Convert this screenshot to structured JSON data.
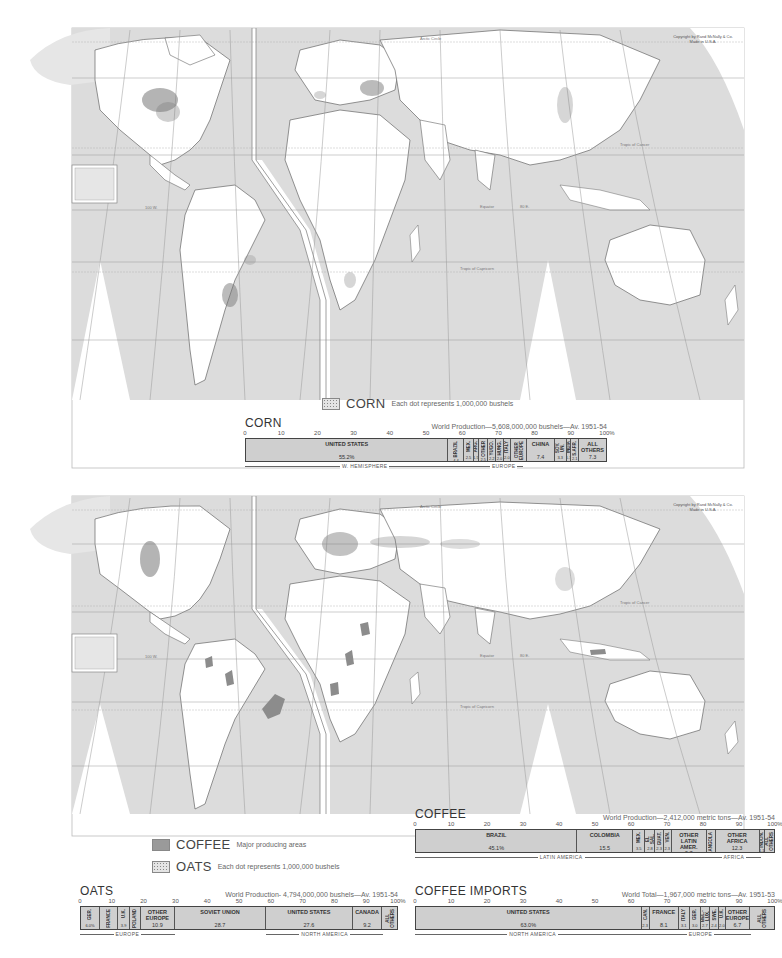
{
  "page": {
    "header_partial": "WORLD — CORN, OATS, COFFEE",
    "copyright": "Copyright by Rand McNally & Co.\nMade in U.S.A."
  },
  "maps": [
    {
      "id": "corn-map",
      "labels": {
        "arctic_circle": "Arctic Circle",
        "tropic_cancer": "Tropic of Cancer",
        "equator": "Equator",
        "tropic_capricorn": "Tropic of Capricorn",
        "meridian_w": "100 W.",
        "meridian_e": "80 E.",
        "lat_40": "40",
        "lat_20": "20",
        "lat_0": "0",
        "inset_lat": "140",
        "inset_lat2": "20"
      },
      "legend": [
        {
          "title": "CORN",
          "desc": "Each dot represents 1,000,000 bushels",
          "swatch": "dots"
        }
      ]
    },
    {
      "id": "oats-coffee-map",
      "labels": {
        "arctic_circle": "Arctic Circle",
        "tropic_cancer": "Tropic of Cancer",
        "equator": "Equator",
        "tropic_capricorn": "Tropic of Capricorn",
        "meridian_w": "100 W.",
        "meridian_e": "80 E.",
        "inset_lat": "140",
        "inset_lat2": "20"
      },
      "legend": [
        {
          "title": "COFFEE",
          "desc": "Major producing areas",
          "swatch": "solid"
        },
        {
          "title": "OATS",
          "desc": "Each dot represents 1,000,000 bushels",
          "swatch": "dots"
        }
      ]
    }
  ],
  "colors": {
    "ocean": "#dcdcdc",
    "land": "#ffffff",
    "coastline": "#666666",
    "grid": "#999999",
    "bar_fill": "#cfcfcf",
    "coffee_area": "#9a9a9a"
  },
  "chart_data": [
    {
      "type": "bar",
      "stacked": true,
      "orientation": "horizontal",
      "title": "CORN",
      "subtitle": "World Production—5,608,000,000 bushels—Av. 1951-54",
      "axis_ticks": [
        "0",
        "10",
        "20",
        "30",
        "40",
        "50",
        "60",
        "70",
        "80",
        "90",
        "100%"
      ],
      "xlim": [
        0,
        100
      ],
      "categories": [
        "UNITED STATES",
        "BRAZIL",
        "MEX.",
        "ARG.",
        "OTHER",
        "YUGO.",
        "HUNG.",
        "ITALY",
        "OTHER EUROPE",
        "CHINA",
        "SOV. UN.",
        "INDIA",
        "S.AFR.",
        "ALL OTHERS"
      ],
      "values": [
        55.2,
        4.4,
        2.5,
        1.5,
        2.5,
        2.2,
        2.0,
        2.0,
        4.5,
        7.4,
        3.3,
        1.3,
        2.1,
        7.3
      ],
      "unit": "%",
      "groups": [
        {
          "label": "W. HEMISPHERE",
          "from": 0,
          "to": 66.1
        },
        {
          "label": "EUROPE",
          "from": 66.1,
          "to": 76.8
        }
      ]
    },
    {
      "type": "bar",
      "stacked": true,
      "orientation": "horizontal",
      "title": "OATS",
      "subtitle": "World Production- 4,794,000,000 bushels—Av. 1951-54",
      "axis_ticks": [
        "0",
        "10",
        "20",
        "30",
        "40",
        "50",
        "60",
        "70",
        "80",
        "90",
        "100%"
      ],
      "xlim": [
        0,
        100
      ],
      "categories": [
        "GER.",
        "FRANCE",
        "U.K.",
        "POLAND",
        "OTHER EUROPE",
        "SOVIET UNION",
        "UNITED STATES",
        "CANADA",
        "ALL OTHERS"
      ],
      "values": [
        6.0,
        5.7,
        3.9,
        3.3,
        10.9,
        28.7,
        27.6,
        9.2,
        5.0
      ],
      "unit": "%",
      "groups": [
        {
          "label": "EUROPE",
          "from": 0,
          "to": 29.8
        },
        {
          "label": "NORTH AMERICA",
          "from": 58.5,
          "to": 95.3
        }
      ]
    },
    {
      "type": "bar",
      "stacked": true,
      "orientation": "horizontal",
      "title": "COFFEE",
      "subtitle": "World Production—2,412,000 metric tons—Av. 1951-54",
      "axis_ticks": [
        "0",
        "10",
        "20",
        "30",
        "40",
        "50",
        "60",
        "70",
        "80",
        "90",
        "100%"
      ],
      "xlim": [
        0,
        100
      ],
      "categories": [
        "BRAZIL",
        "COLOMBIA",
        "MEX.",
        "EL SAL.",
        "GUAT.",
        "VEN.",
        "OTHER LATIN AMER.",
        "ANGOLA",
        "OTHER AFRICA",
        "INDON.",
        "ALL OTHERS"
      ],
      "values": [
        45.1,
        15.5,
        3.5,
        2.8,
        2.3,
        2.3,
        9.7,
        2.5,
        12.3,
        1.1,
        2.9
      ],
      "unit": "%",
      "groups": [
        {
          "label": "LATIN AMERICA",
          "from": 0,
          "to": 81.2
        },
        {
          "label": "AFRICA",
          "from": 81.2,
          "to": 96.0
        }
      ]
    },
    {
      "type": "bar",
      "stacked": true,
      "orientation": "horizontal",
      "title": "COFFEE IMPORTS",
      "subtitle": "World Total—1,967,000 metric tons—Av. 1951-53",
      "axis_ticks": [
        "0",
        "10",
        "20",
        "30",
        "40",
        "50",
        "60",
        "70",
        "80",
        "90",
        "100%"
      ],
      "xlim": [
        0,
        100
      ],
      "categories": [
        "UNITED STATES",
        "CAN.",
        "FRANCE",
        "ITALY",
        "GER.",
        "BEL.-LUX.",
        "SWE.",
        "U.K.",
        "OTHER EUROPE",
        "ALL OTHERS"
      ],
      "values": [
        63.0,
        2.3,
        8.1,
        3.1,
        3.0,
        2.7,
        2.4,
        2.0,
        6.7,
        6.7
      ],
      "unit": "%",
      "groups": [
        {
          "label": "NORTH AMERICA",
          "from": 0,
          "to": 65.3
        },
        {
          "label": "EUROPE",
          "from": 65.3,
          "to": 93.3
        }
      ]
    }
  ],
  "charts_display": {
    "corn": {
      "title": "CORN",
      "subtitle": "World Production—5,608,000,000 bushels—Av. 1951-54",
      "segments": [
        {
          "label": "UNITED STATES",
          "value": "55.2%",
          "w": 55.2
        },
        {
          "label": "BRAZIL",
          "value": "4.4",
          "w": 4.4,
          "narrow": true
        },
        {
          "label": "MEX.",
          "value": "2.5",
          "w": 2.5,
          "narrow": true
        },
        {
          "label": "ARG.",
          "value": "1.5",
          "w": 1.5,
          "narrow": true
        },
        {
          "label": "OTHER",
          "value": "2.5",
          "w": 2.5,
          "narrow": true
        },
        {
          "label": "YUGO.",
          "value": "2.2",
          "w": 2.2,
          "narrow": true
        },
        {
          "label": "HUNG.",
          "value": "2.0",
          "w": 2.0,
          "narrow": true
        },
        {
          "label": "ITALY",
          "value": "2.0",
          "w": 2.0,
          "narrow": true
        },
        {
          "label": "OTHER EUROPE",
          "value": "4.5",
          "w": 4.5,
          "narrow": true
        },
        {
          "label": "CHINA",
          "value": "7.4",
          "w": 7.4
        },
        {
          "label": "SOV. UN.",
          "value": "3.3",
          "w": 3.3,
          "narrow": true
        },
        {
          "label": "INDIA",
          "value": "1.3",
          "w": 1.3,
          "narrow": true
        },
        {
          "label": "S.AFR.",
          "value": "2.1",
          "w": 2.1,
          "narrow": true
        },
        {
          "label": "ALL\nOTHERS",
          "value": "7.3",
          "w": 7.3
        }
      ],
      "regions": [
        {
          "label": "W. HEMISPHERE",
          "from": 0,
          "to": 66.1
        },
        {
          "label": "EUROPE",
          "from": 66.1,
          "to": 76.8
        }
      ]
    },
    "oats": {
      "title": "OATS",
      "subtitle": "World Production- 4,794,000,000 bushels—Av. 1951-54",
      "segments": [
        {
          "label": "GER.",
          "value": "6.0%",
          "w": 6.0,
          "narrow": true
        },
        {
          "label": "FRANCE",
          "value": "5.7",
          "w": 5.7,
          "narrow": true
        },
        {
          "label": "U.K.",
          "value": "3.9",
          "w": 3.9,
          "narrow": true
        },
        {
          "label": "POLAND",
          "value": "3.3",
          "w": 3.3,
          "narrow": true
        },
        {
          "label": "OTHER\nEUROPE",
          "value": "10.9",
          "w": 10.9
        },
        {
          "label": "SOVIET  UNION",
          "value": "28.7",
          "w": 28.7
        },
        {
          "label": "UNITED STATES",
          "value": "27.6",
          "w": 27.6
        },
        {
          "label": "CANADA",
          "value": "9.2",
          "w": 9.2
        },
        {
          "label": "ALL OTHERS",
          "value": "5.",
          "w": 4.7,
          "narrow": true
        }
      ],
      "regions": [
        {
          "label": "EUROPE",
          "from": 0,
          "to": 29.8
        },
        {
          "label": "NORTH AMERICA",
          "from": 58.5,
          "to": 95.3
        }
      ]
    },
    "coffee": {
      "title": "COFFEE",
      "subtitle": "World Production—2,412,000 metric tons—Av. 1951-54",
      "segments": [
        {
          "label": "BRAZIL",
          "value": "45.1%",
          "w": 45.1
        },
        {
          "label": "COLOMBIA",
          "value": "15.5",
          "w": 15.5
        },
        {
          "label": "MEX.",
          "value": "3.5",
          "w": 3.5,
          "narrow": true
        },
        {
          "label": "EL SAL.",
          "value": "2.8",
          "w": 2.8,
          "narrow": true
        },
        {
          "label": "GUAT.",
          "value": "2.3",
          "w": 2.3,
          "narrow": true
        },
        {
          "label": "VEN.",
          "value": "2.3",
          "w": 2.3,
          "narrow": true
        },
        {
          "label": "OTHER\nLATIN\nAMER.",
          "value": "9.7",
          "w": 9.7
        },
        {
          "label": "ANGOLA",
          "value": "2.5",
          "w": 2.5,
          "narrow": true
        },
        {
          "label": "OTHER\nAFRICA",
          "value": "12.3",
          "w": 12.3
        },
        {
          "label": "INDON.",
          "value": "1.1",
          "w": 1.5,
          "narrow": true
        },
        {
          "label": "ALL OTHERS",
          "value": "2.9",
          "w": 2.5,
          "narrow": true
        }
      ],
      "regions": [
        {
          "label": "LATIN AMERICA",
          "from": 0,
          "to": 81.2
        },
        {
          "label": "AFRICA",
          "from": 81.2,
          "to": 96.0
        }
      ]
    },
    "coffee_imports": {
      "title": "COFFEE IMPORTS",
      "subtitle": "World Total—1,967,000 metric tons—Av. 1951-53",
      "segments": [
        {
          "label": "UNITED STATES",
          "value": "63.0%",
          "w": 63.0
        },
        {
          "label": "CAN.",
          "value": "2.3",
          "w": 2.3,
          "narrow": true
        },
        {
          "label": "FRANCE",
          "value": "8.1",
          "w": 8.1
        },
        {
          "label": "ITALY",
          "value": "3.1",
          "w": 3.1,
          "narrow": true
        },
        {
          "label": "GER.",
          "value": "3.0",
          "w": 3.0,
          "narrow": true
        },
        {
          "label": "BEL.-LUX.",
          "value": "2.7",
          "w": 2.7,
          "narrow": true
        },
        {
          "label": "SWE.",
          "value": "2.4",
          "w": 2.4,
          "narrow": true
        },
        {
          "label": "U.K.",
          "value": "2.0",
          "w": 2.0,
          "narrow": true
        },
        {
          "label": "OTHER\nEUROPE",
          "value": "6.7",
          "w": 6.7
        },
        {
          "label": "ALL OTHERS",
          "value": "6.7",
          "w": 6.7,
          "narrow": true
        }
      ],
      "regions": [
        {
          "label": "NORTH AMERICA",
          "from": 0,
          "to": 65.3
        },
        {
          "label": "EUROPE",
          "from": 65.3,
          "to": 93.3
        }
      ]
    }
  },
  "axis_ticks": [
    "0",
    "10",
    "20",
    "30",
    "40",
    "50",
    "60",
    "70",
    "80",
    "90",
    "100%"
  ]
}
